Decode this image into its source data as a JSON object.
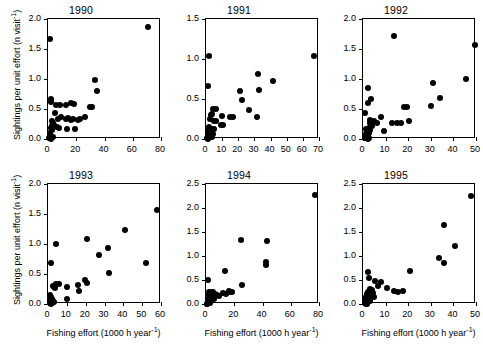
{
  "figure": {
    "xlabel": "Fishing effort (1000 h year⁻¹)",
    "ylabel": "Sightings per unit effort (n visit⁻¹)",
    "marker_color": "#000000",
    "axis_color": "#000000",
    "background": "#ffffff"
  },
  "chart_data": [
    {
      "type": "scatter",
      "title": "1990",
      "xlabel": "Fishing effort (1000 h year⁻¹)",
      "ylabel": "Sightings per unit effort (n visit⁻¹)",
      "xlim": [
        0,
        80
      ],
      "ylim": [
        0.0,
        2.0
      ],
      "xticks": [
        0,
        20,
        40,
        60,
        80
      ],
      "yticks": [
        0.0,
        0.5,
        1.0,
        1.5,
        2.0
      ],
      "grid": false,
      "legend": null,
      "points": [
        [
          1.5,
          1.66
        ],
        [
          71.0,
          1.87
        ],
        [
          33.5,
          0.98
        ],
        [
          34.5,
          0.8
        ],
        [
          29.5,
          0.53
        ],
        [
          31.0,
          0.53
        ],
        [
          2.0,
          0.66
        ],
        [
          2.2,
          0.62
        ],
        [
          8.5,
          0.57
        ],
        [
          13.0,
          0.57
        ],
        [
          16.5,
          0.6
        ],
        [
          18.5,
          0.59
        ],
        [
          5.5,
          0.57
        ],
        [
          5.0,
          0.43
        ],
        [
          7.0,
          0.33
        ],
        [
          9.5,
          0.36
        ],
        [
          12.5,
          0.33
        ],
        [
          14.0,
          0.35
        ],
        [
          16.0,
          0.32
        ],
        [
          18.0,
          0.33
        ],
        [
          21.0,
          0.32
        ],
        [
          23.0,
          0.34
        ],
        [
          26.5,
          0.36
        ],
        [
          3.0,
          0.3
        ],
        [
          3.5,
          0.26
        ],
        [
          4.0,
          0.23
        ],
        [
          2.5,
          0.21
        ],
        [
          1.8,
          0.18
        ],
        [
          2.8,
          0.15
        ],
        [
          6.5,
          0.2
        ],
        [
          8.0,
          0.19
        ],
        [
          13.5,
          0.17
        ],
        [
          19.0,
          0.16
        ],
        [
          1.2,
          0.1
        ],
        [
          1.6,
          0.05
        ],
        [
          2.0,
          0.02
        ],
        [
          2.4,
          0.0
        ],
        [
          3.2,
          0.03
        ],
        [
          0.8,
          0.01
        ]
      ]
    },
    {
      "type": "scatter",
      "title": "1991",
      "xlabel": "Fishing effort (1000 h year⁻¹)",
      "ylabel": "Sightings per unit effort (n visit⁻¹)",
      "xlim": [
        0,
        70
      ],
      "ylim": [
        0.0,
        1.5
      ],
      "xticks": [
        0,
        10,
        20,
        30,
        40,
        50,
        60,
        70
      ],
      "yticks": [
        0.0,
        0.5,
        1.0,
        1.5
      ],
      "grid": false,
      "legend": null,
      "points": [
        [
          2.0,
          1.04
        ],
        [
          67.0,
          1.04
        ],
        [
          32.0,
          0.81
        ],
        [
          41.5,
          0.72
        ],
        [
          33.0,
          0.61
        ],
        [
          21.0,
          0.6
        ],
        [
          22.0,
          0.49
        ],
        [
          1.5,
          0.66
        ],
        [
          26.5,
          0.36
        ],
        [
          31.5,
          0.28
        ],
        [
          4.5,
          0.37
        ],
        [
          6.0,
          0.37
        ],
        [
          3.0,
          0.3
        ],
        [
          4.0,
          0.31
        ],
        [
          10.0,
          0.29
        ],
        [
          15.0,
          0.28
        ],
        [
          17.0,
          0.28
        ],
        [
          2.5,
          0.25
        ],
        [
          5.0,
          0.22
        ],
        [
          6.5,
          0.22
        ],
        [
          9.5,
          0.18
        ],
        [
          10.5,
          0.17
        ],
        [
          2.0,
          0.15
        ],
        [
          3.2,
          0.13
        ],
        [
          4.2,
          0.12
        ],
        [
          5.2,
          0.13
        ],
        [
          1.2,
          0.1
        ],
        [
          2.2,
          0.08
        ],
        [
          3.0,
          0.07
        ],
        [
          4.5,
          0.06
        ],
        [
          1.0,
          0.05
        ],
        [
          1.8,
          0.03
        ],
        [
          2.6,
          0.02
        ],
        [
          0.6,
          0.01
        ],
        [
          1.4,
          0.0
        ],
        [
          3.6,
          0.02
        ]
      ]
    },
    {
      "type": "scatter",
      "title": "1992",
      "xlabel": "Fishing effort (1000 h year⁻¹)",
      "ylabel": "Sightings per unit effort (n visit⁻¹)",
      "xlim": [
        0,
        50
      ],
      "ylim": [
        0.0,
        2.0
      ],
      "xticks": [
        0,
        10,
        20,
        30,
        40,
        50
      ],
      "yticks": [
        0.0,
        0.5,
        1.0,
        1.5,
        2.0
      ],
      "grid": false,
      "legend": null,
      "points": [
        [
          13.8,
          1.72
        ],
        [
          49.5,
          1.57
        ],
        [
          45.5,
          1.0
        ],
        [
          31.0,
          0.93
        ],
        [
          34.0,
          0.68
        ],
        [
          30.0,
          0.55
        ],
        [
          2.0,
          0.85
        ],
        [
          3.5,
          0.66
        ],
        [
          2.2,
          0.6
        ],
        [
          1.0,
          0.43
        ],
        [
          18.0,
          0.53
        ],
        [
          19.5,
          0.53
        ],
        [
          8.0,
          0.37
        ],
        [
          13.0,
          0.27
        ],
        [
          15.0,
          0.26
        ],
        [
          17.0,
          0.27
        ],
        [
          20.5,
          0.3
        ],
        [
          5.0,
          0.3
        ],
        [
          6.0,
          0.27
        ],
        [
          9.5,
          0.14
        ],
        [
          3.0,
          0.26
        ],
        [
          3.8,
          0.22
        ],
        [
          2.5,
          0.19
        ],
        [
          3.2,
          0.15
        ],
        [
          2.0,
          0.13
        ],
        [
          2.6,
          0.1
        ],
        [
          1.6,
          0.12
        ],
        [
          2.2,
          0.08
        ],
        [
          1.2,
          0.09
        ],
        [
          1.8,
          0.06
        ],
        [
          2.4,
          0.04
        ],
        [
          1.0,
          0.04
        ],
        [
          1.5,
          0.02
        ],
        [
          0.8,
          0.01
        ],
        [
          2.0,
          0.0
        ],
        [
          2.8,
          0.01
        ],
        [
          1.3,
          0.17
        ],
        [
          2.9,
          0.31
        ]
      ]
    },
    {
      "type": "scatter",
      "title": "1993",
      "xlabel": "Fishing effort (1000 h year⁻¹)",
      "ylabel": "Sightings per unit effort (n visit⁻¹)",
      "xlim": [
        0,
        60
      ],
      "ylim": [
        0.0,
        2.0
      ],
      "xticks": [
        0,
        10,
        20,
        30,
        40,
        50,
        60
      ],
      "yticks": [
        0.0,
        0.5,
        1.0,
        1.5,
        2.0
      ],
      "grid": false,
      "legend": null,
      "points": [
        [
          58.0,
          1.57
        ],
        [
          41.0,
          1.24
        ],
        [
          20.5,
          1.08
        ],
        [
          4.0,
          1.0
        ],
        [
          32.0,
          0.93
        ],
        [
          27.0,
          0.82
        ],
        [
          1.5,
          0.68
        ],
        [
          52.0,
          0.68
        ],
        [
          32.5,
          0.52
        ],
        [
          19.5,
          0.4
        ],
        [
          20.5,
          0.35
        ],
        [
          16.0,
          0.31
        ],
        [
          4.5,
          0.33
        ],
        [
          6.0,
          0.33
        ],
        [
          3.0,
          0.28
        ],
        [
          3.8,
          0.26
        ],
        [
          10.0,
          0.29
        ],
        [
          2.5,
          0.3
        ],
        [
          16.5,
          0.22
        ],
        [
          10.0,
          0.08
        ],
        [
          1.2,
          0.15
        ],
        [
          1.8,
          0.11
        ],
        [
          2.2,
          0.08
        ],
        [
          1.0,
          0.07
        ],
        [
          1.6,
          0.04
        ],
        [
          2.6,
          0.05
        ],
        [
          0.8,
          0.02
        ],
        [
          1.4,
          0.0
        ],
        [
          2.0,
          0.01
        ],
        [
          3.2,
          0.03
        ]
      ]
    },
    {
      "type": "scatter",
      "title": "1994",
      "xlabel": "Fishing effort (1000 h year⁻¹)",
      "ylabel": "Sightings per unit effort (n visit⁻¹)",
      "xlim": [
        0,
        80
      ],
      "ylim": [
        0.0,
        2.5
      ],
      "xticks": [
        0,
        20,
        40,
        60,
        80
      ],
      "yticks": [
        0.0,
        0.5,
        1.0,
        1.5,
        2.0,
        2.5
      ],
      "grid": false,
      "legend": null,
      "points": [
        [
          77.0,
          2.28
        ],
        [
          25.0,
          1.34
        ],
        [
          43.0,
          1.31
        ],
        [
          42.5,
          0.87
        ],
        [
          42.8,
          0.81
        ],
        [
          13.5,
          0.68
        ],
        [
          1.5,
          0.51
        ],
        [
          25.5,
          0.4
        ],
        [
          16.0,
          0.27
        ],
        [
          17.0,
          0.25
        ],
        [
          18.5,
          0.24
        ],
        [
          14.0,
          0.2
        ],
        [
          12.0,
          0.22
        ],
        [
          9.5,
          0.17
        ],
        [
          8.0,
          0.19
        ],
        [
          6.5,
          0.21
        ],
        [
          5.0,
          0.24
        ],
        [
          4.0,
          0.26
        ],
        [
          3.0,
          0.21
        ],
        [
          3.5,
          0.17
        ],
        [
          2.5,
          0.14
        ],
        [
          2.0,
          0.24
        ],
        [
          1.8,
          0.18
        ],
        [
          1.2,
          0.11
        ],
        [
          1.5,
          0.06
        ],
        [
          2.2,
          0.04
        ],
        [
          2.8,
          0.02
        ],
        [
          0.8,
          0.01
        ],
        [
          1.0,
          0.0
        ],
        [
          3.8,
          0.08
        ],
        [
          6.0,
          0.1
        ]
      ]
    },
    {
      "type": "scatter",
      "title": "1995",
      "xlabel": "Fishing effort (1000 h year⁻¹)",
      "ylabel": "Sightings per unit effort (n visit⁻¹)",
      "xlim": [
        0,
        50
      ],
      "ylim": [
        0.0,
        2.5
      ],
      "xticks": [
        0,
        10,
        20,
        30,
        40,
        50
      ],
      "yticks": [
        0.0,
        0.5,
        1.0,
        1.5,
        2.0,
        2.5
      ],
      "grid": false,
      "legend": null,
      "points": [
        [
          48.0,
          2.26
        ],
        [
          36.0,
          1.65
        ],
        [
          40.5,
          1.2
        ],
        [
          33.5,
          0.95
        ],
        [
          36.0,
          0.85
        ],
        [
          21.0,
          0.68
        ],
        [
          2.0,
          0.66
        ],
        [
          2.5,
          0.55
        ],
        [
          5.5,
          0.47
        ],
        [
          8.0,
          0.46
        ],
        [
          6.5,
          0.38
        ],
        [
          10.5,
          0.33
        ],
        [
          13.5,
          0.27
        ],
        [
          15.5,
          0.26
        ],
        [
          17.5,
          0.27
        ],
        [
          3.0,
          0.31
        ],
        [
          4.0,
          0.29
        ],
        [
          4.5,
          0.23
        ],
        [
          2.2,
          0.26
        ],
        [
          3.5,
          0.2
        ],
        [
          2.8,
          0.17
        ],
        [
          1.8,
          0.21
        ],
        [
          1.4,
          0.15
        ],
        [
          2.0,
          0.12
        ],
        [
          2.6,
          0.09
        ],
        [
          1.0,
          0.1
        ],
        [
          1.6,
          0.06
        ],
        [
          2.3,
          0.04
        ],
        [
          0.8,
          0.03
        ],
        [
          1.2,
          0.01
        ],
        [
          1.9,
          0.0
        ],
        [
          3.2,
          0.06
        ],
        [
          5.0,
          0.14
        ]
      ]
    }
  ]
}
